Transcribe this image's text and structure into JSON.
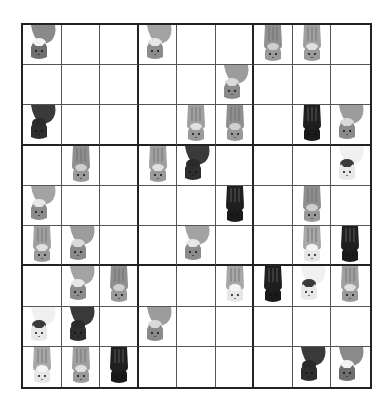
{
  "puzzle": {
    "type": "cat sudoku",
    "size": 9,
    "cat_types": {
      "A": {
        "name": "gray-curled-cat",
        "body": "#8a8a8a",
        "accent": "#f2f2f2",
        "face": "#6e6e6e",
        "pose": "curled"
      },
      "B": {
        "name": "black-curled-cat",
        "body": "#3a3a3a",
        "accent": "#2a2a2a",
        "face": "#2e2e2e",
        "pose": "curled"
      },
      "C": {
        "name": "striped-tabby-cat",
        "body": "#8f8f8f",
        "accent": "#cfcfcf",
        "face": "#9a9a9a",
        "pose": "standing"
      },
      "D": {
        "name": "gray-fluffy-cat",
        "body": "#a3a3a3",
        "accent": "#e6e6e6",
        "face": "#8c8c8c",
        "pose": "curled"
      },
      "E": {
        "name": "black-standing-cat",
        "body": "#1f1f1f",
        "accent": "#1f1f1f",
        "face": "#1a1a1a",
        "pose": "standing"
      },
      "F": {
        "name": "calico-white-cat",
        "body": "#f0f0f0",
        "accent": "#3a3a3a",
        "face": "#e8e8e8",
        "pose": "curled"
      },
      "G": {
        "name": "light-tabby-white-cat",
        "body": "#a8a8a8",
        "accent": "#f4f4f4",
        "face": "#e6e6e6",
        "pose": "standing"
      },
      "H": {
        "name": "gray-curled-fluffy-cat",
        "body": "#9c9c9c",
        "accent": "#d9d9d9",
        "face": "#8a8a8a",
        "pose": "curled"
      },
      "I": {
        "name": "light-striped-cat",
        "body": "#a0a0a0",
        "accent": "#e0e0e0",
        "face": "#9a9a9a",
        "pose": "standing"
      }
    },
    "grid": [
      [
        "A",
        "",
        "",
        "D",
        "",
        "",
        "C",
        "I",
        ""
      ],
      [
        "",
        "",
        "",
        "",
        "",
        "H",
        "",
        "",
        ""
      ],
      [
        "B",
        "",
        "",
        "",
        "I",
        "C",
        "",
        "E",
        "H"
      ],
      [
        "",
        "C",
        "",
        "I",
        "B",
        "",
        "",
        "",
        "F"
      ],
      [
        "D",
        "",
        "",
        "",
        "",
        "E",
        "",
        "C",
        ""
      ],
      [
        "I",
        "H",
        "",
        "",
        "D",
        "",
        "",
        "G",
        "E"
      ],
      [
        "",
        "D",
        "C",
        "",
        "",
        "G",
        "E",
        "F",
        "I"
      ],
      [
        "F",
        "B",
        "",
        "H",
        "",
        "",
        "",
        "",
        ""
      ],
      [
        "G",
        "I",
        "E",
        "",
        "",
        "",
        "",
        "B",
        "A"
      ]
    ]
  }
}
